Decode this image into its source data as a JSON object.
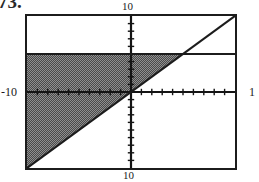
{
  "figure": {
    "number_label": "73."
  },
  "axis_labels": {
    "top": "10",
    "left": "-10",
    "right": "1",
    "bottom": "10"
  },
  "chart_data": {
    "type": "area",
    "title": "",
    "subtitle": "",
    "xlabel": "",
    "ylabel": "",
    "xlim": [
      -10,
      10
    ],
    "ylim": [
      -10,
      10
    ],
    "xticks": [
      -9,
      -8,
      -7,
      -6,
      -5,
      -4,
      -3,
      -2,
      -1,
      1,
      2,
      3,
      4,
      5,
      6,
      7,
      8,
      9
    ],
    "yticks": [
      -9,
      -8,
      -7,
      -6,
      -5,
      -4,
      -3,
      -2,
      -1,
      1,
      2,
      3,
      4,
      5,
      6,
      7,
      8,
      9
    ],
    "tick_label_text": [],
    "grid": false,
    "legend": false,
    "legend_position": "none",
    "axes_style": "centered-crosshair",
    "series": [
      {
        "name": "y = 5",
        "type": "line",
        "style": "solid",
        "color": "#1c1c1c",
        "x": [
          -10,
          10
        ],
        "y": [
          5,
          5
        ]
      },
      {
        "name": "y = x",
        "type": "line",
        "style": "solid",
        "color": "#1c1c1c",
        "x": [
          -10,
          10
        ],
        "y": [
          -10,
          10
        ]
      }
    ],
    "shaded_region": {
      "name": "y <= 5 and y >= x",
      "fill": "#6e6e6e",
      "pattern": "dither-50",
      "vertices_xy": [
        [
          -10,
          5
        ],
        [
          5,
          5
        ],
        [
          -10,
          -10
        ]
      ],
      "description": "region below the line y = 5 and above the line y = x"
    },
    "annotations": []
  }
}
